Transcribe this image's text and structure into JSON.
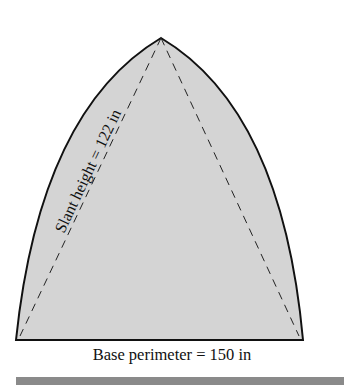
{
  "figure": {
    "shape": "curved pyramid / cone face (ogive)",
    "slant_label": "Slant height = 122 in",
    "base_label": "Base perimeter = 150 in",
    "colors": {
      "fill": "#d4d4d4",
      "outline": "#111111",
      "dashed": "#222222",
      "footer_bar": "#8a8a8a"
    }
  }
}
